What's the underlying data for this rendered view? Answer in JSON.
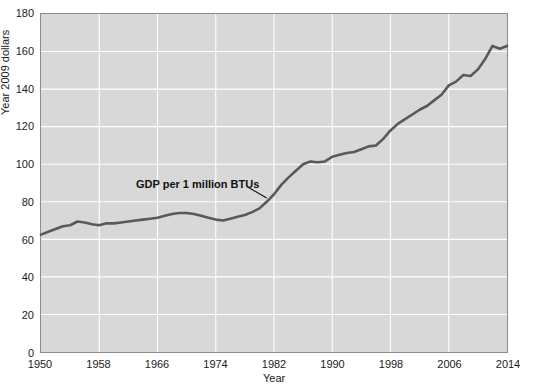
{
  "chart_data": {
    "type": "line",
    "title": "",
    "xlabel": "Year",
    "ylabel": "Year 2009 dollars",
    "xlim": [
      1950,
      2014
    ],
    "ylim": [
      0,
      180
    ],
    "grid": true,
    "legend_position": "none",
    "line_color": "#595959",
    "plot_background": "#d8d8d8",
    "gridline_color": "#ffffff",
    "xticks": [
      1950,
      1958,
      1966,
      1974,
      1982,
      1990,
      1998,
      2006,
      2014
    ],
    "yticks": [
      0,
      20,
      40,
      60,
      80,
      100,
      120,
      140,
      160,
      180
    ],
    "annotations": [
      {
        "text": "GDP per 1 million BTUs",
        "x": 1972,
        "y": 88,
        "leader_to_x": 1981,
        "leader_to_y": 82
      }
    ],
    "series": [
      {
        "name": "GDP per 1 million BTUs",
        "x": [
          1950,
          1951,
          1952,
          1953,
          1954,
          1955,
          1956,
          1957,
          1958,
          1959,
          1960,
          1961,
          1962,
          1963,
          1964,
          1965,
          1966,
          1967,
          1968,
          1969,
          1970,
          1971,
          1972,
          1973,
          1974,
          1975,
          1976,
          1977,
          1978,
          1979,
          1980,
          1981,
          1982,
          1983,
          1984,
          1985,
          1986,
          1987,
          1988,
          1989,
          1990,
          1991,
          1992,
          1993,
          1994,
          1995,
          1996,
          1997,
          1998,
          1999,
          2000,
          2001,
          2002,
          2003,
          2004,
          2005,
          2006,
          2007,
          2008,
          2009,
          2010,
          2011,
          2012,
          2013,
          2014
        ],
        "values": [
          62.5,
          64.0,
          65.5,
          67.0,
          67.5,
          69.5,
          69.0,
          68.0,
          67.5,
          68.5,
          68.5,
          69.0,
          69.5,
          70.0,
          70.5,
          71.0,
          71.5,
          72.5,
          73.5,
          74.0,
          74.0,
          73.5,
          72.5,
          71.5,
          70.5,
          70.0,
          71.0,
          72.0,
          73.0,
          74.5,
          76.5,
          80.0,
          84.0,
          89.0,
          93.0,
          96.5,
          100.0,
          101.5,
          101.0,
          101.5,
          104.0,
          105.0,
          106.0,
          106.5,
          108.0,
          109.5,
          110.0,
          113.5,
          118.0,
          121.5,
          124.0,
          126.5,
          129.0,
          131.0,
          134.0,
          137.0,
          142.0,
          144.0,
          147.5,
          147.0,
          150.5,
          156.0,
          163.0,
          161.5,
          163.0
        ]
      }
    ]
  }
}
